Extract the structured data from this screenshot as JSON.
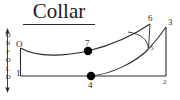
{
  "diagram": {
    "title": "Collar",
    "fold_marker": {
      "name": "on-fold",
      "letters": [
        "O",
        "N",
        "F",
        "O",
        "L",
        "D"
      ],
      "text": "ON FOLD"
    },
    "stroke_color": "#2b2b2b",
    "point_color": "#000000",
    "labels": {
      "origin": "O",
      "p1": "1",
      "p2": "2",
      "p3": "3",
      "p4": "4",
      "p5": "5",
      "p6": "6",
      "p7": "7"
    }
  }
}
